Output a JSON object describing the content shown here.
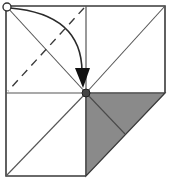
{
  "diagram": {
    "type": "origami-fold-step",
    "colors": {
      "line": "#3a3a3a",
      "shaded_flap": "#8a8a8a",
      "background": "#ffffff",
      "marker": "#444444"
    },
    "elements": {
      "paper_square": "square sheet with center crease lines",
      "valley_fold_line": "dashed diagonal in top-left quadrant",
      "fold_arrow": "curved arrow from top-left corner to center",
      "start_marker": "open circle at top-left corner",
      "target_marker": "filled dot at center",
      "folded_flap": "shaded triangle in bottom-right quadrant"
    }
  }
}
